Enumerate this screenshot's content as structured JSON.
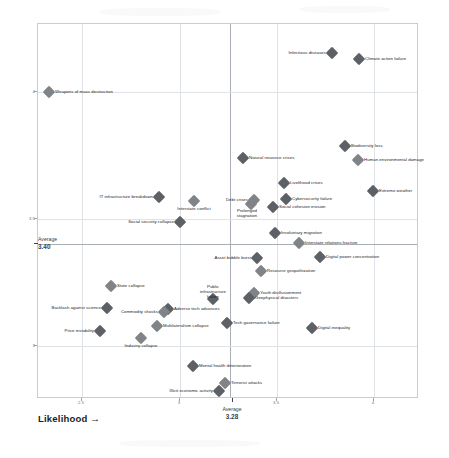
{
  "chart_data": {
    "type": "scatter",
    "title": "",
    "xlabel": "Likelihood →",
    "ylabel": "Impact →",
    "xlim": [
      2.3,
      4.12
    ],
    "ylim": [
      2.72,
      4.3
    ],
    "xticks": [
      "2.5",
      "3",
      "3.5",
      "4"
    ],
    "xtick_values": [
      2.5,
      3.0,
      3.5,
      4.0
    ],
    "yticks": [
      "4",
      "3.5",
      "3"
    ],
    "ytick_values": [
      4.0,
      3.5,
      3.0
    ],
    "grid": true,
    "legend": "none",
    "averages": {
      "x_label": "Average",
      "x_value": "3.28",
      "y_label": "Average",
      "y_value": "3.40"
    },
    "marker_color": "#808388",
    "marker_color_dark": "#5d6166",
    "points": [
      {
        "label": "Infectious diseases",
        "x": 3.54,
        "y": 4.22,
        "px": 331,
        "py": 52,
        "lpos": "left",
        "shade": "dark"
      },
      {
        "label": "Climate action failure",
        "x": 3.68,
        "y": 4.18,
        "px": 358,
        "py": 58,
        "lpos": "right",
        "shade": "dark"
      },
      {
        "label": "Weapons of mass destruction",
        "x": 2.37,
        "y": 4.0,
        "px": 48,
        "py": 91,
        "lpos": "right",
        "shade": "mid"
      },
      {
        "label": "Biodiversity loss",
        "x": 3.4,
        "y": 3.78,
        "px": 344,
        "py": 145,
        "lpos": "right",
        "shade": "dark"
      },
      {
        "label": "Natural resource crises",
        "x": 3.17,
        "y": 3.74,
        "px": 242,
        "py": 157,
        "lpos": "right",
        "shade": "dark"
      },
      {
        "label": "Human environmental damage",
        "x": 3.67,
        "y": 3.72,
        "px": 357,
        "py": 159,
        "lpos": "right",
        "shade": "mid"
      },
      {
        "label": "Livelihood crises",
        "x": 3.32,
        "y": 3.6,
        "px": 283,
        "py": 182,
        "lpos": "right",
        "shade": "dark"
      },
      {
        "label": "Debt crises",
        "x": 3.22,
        "y": 3.54,
        "px": 253,
        "py": 199,
        "lpos": "left",
        "shade": "mid"
      },
      {
        "label": "Extreme weather",
        "x": 3.8,
        "y": 3.58,
        "px": 372,
        "py": 190,
        "lpos": "right",
        "shade": "dark"
      },
      {
        "label": "Cybersecurity failure",
        "x": 3.31,
        "y": 3.52,
        "px": 285,
        "py": 198,
        "lpos": "right",
        "shade": "dark"
      },
      {
        "label": "IT infrastructure breakdown",
        "x": 3.0,
        "y": 3.55,
        "px": 158,
        "py": 196,
        "lpos": "left",
        "shade": "dark"
      },
      {
        "label": "Interstate conflict",
        "x": 3.08,
        "y": 3.52,
        "px": 193,
        "py": 200,
        "lpos": "below",
        "shade": "mid"
      },
      {
        "label": "Prolonged stagnation",
        "x": 3.2,
        "y": 3.5,
        "px": 250,
        "py": 203,
        "lpos": "below",
        "shade": "mid"
      },
      {
        "label": "Social cohesion erosion",
        "x": 3.29,
        "y": 3.49,
        "px": 272,
        "py": 206,
        "lpos": "right",
        "shade": "dark"
      },
      {
        "label": "Social security collapse",
        "x": 3.05,
        "y": 3.44,
        "px": 179,
        "py": 221,
        "lpos": "left",
        "shade": "dark"
      },
      {
        "label": "Involuntary migration",
        "x": 3.35,
        "y": 3.42,
        "px": 274,
        "py": 232,
        "lpos": "right",
        "shade": "dark"
      },
      {
        "label": "Interstate relations fracture",
        "x": 3.46,
        "y": 3.4,
        "px": 298,
        "py": 242,
        "lpos": "right",
        "shade": "mid"
      },
      {
        "label": "Asset bubble burst",
        "x": 3.26,
        "y": 3.36,
        "px": 256,
        "py": 257,
        "lpos": "left",
        "shade": "dark"
      },
      {
        "label": "Digital power concentration",
        "x": 3.63,
        "y": 3.36,
        "px": 319,
        "py": 256,
        "lpos": "right",
        "shade": "dark"
      },
      {
        "label": "Resource geopolitization",
        "x": 3.42,
        "y": 3.31,
        "px": 260,
        "py": 270,
        "lpos": "right",
        "shade": "mid"
      },
      {
        "label": "State collapse",
        "x": 2.69,
        "y": 3.26,
        "px": 110,
        "py": 285,
        "lpos": "right",
        "shade": "mid"
      },
      {
        "label": "Youth disillusionment",
        "x": 3.46,
        "y": 3.25,
        "px": 253,
        "py": 292,
        "lpos": "right",
        "shade": "mid"
      },
      {
        "label": "Public infrastructure failure",
        "x": 3.22,
        "y": 3.2,
        "px": 212,
        "py": 298,
        "lpos": "above",
        "shade": "dark"
      },
      {
        "label": "Geophysical disasters",
        "x": 3.42,
        "y": 3.22,
        "px": 248,
        "py": 297,
        "lpos": "right",
        "shade": "dark"
      },
      {
        "label": "Backlash against science",
        "x": 2.76,
        "y": 3.2,
        "px": 106,
        "py": 307,
        "lpos": "left",
        "shade": "dark"
      },
      {
        "label": "Adverse tech advances",
        "x": 3.1,
        "y": 3.2,
        "px": 167,
        "py": 308,
        "lpos": "right",
        "shade": "dark"
      },
      {
        "label": "Commodity shocks",
        "x": 3.07,
        "y": 3.18,
        "px": 163,
        "py": 311,
        "lpos": "left",
        "shade": "mid"
      },
      {
        "label": "Tech governance failure",
        "x": 3.33,
        "y": 3.15,
        "px": 226,
        "py": 322,
        "lpos": "right",
        "shade": "dark"
      },
      {
        "label": "Price instability",
        "x": 2.64,
        "y": 3.12,
        "px": 99,
        "py": 330,
        "lpos": "left",
        "shade": "dark"
      },
      {
        "label": "Multilateralism collapse",
        "x": 3.0,
        "y": 3.14,
        "px": 156,
        "py": 325,
        "lpos": "right",
        "shade": "mid"
      },
      {
        "label": "Digital inequality",
        "x": 3.62,
        "y": 3.13,
        "px": 311,
        "py": 327,
        "lpos": "right",
        "shade": "dark"
      },
      {
        "label": "Industry collapse",
        "x": 2.92,
        "y": 3.1,
        "px": 140,
        "py": 337,
        "lpos": "below",
        "shade": "mid"
      },
      {
        "label": "Mental health deterioration",
        "x": 3.13,
        "y": 2.97,
        "px": 192,
        "py": 365,
        "lpos": "right",
        "shade": "dark"
      },
      {
        "label": "Terrorist attacks",
        "x": 3.25,
        "y": 2.9,
        "px": 224,
        "py": 382,
        "lpos": "right",
        "shade": "mid"
      },
      {
        "label": "Illicit economic activity",
        "x": 3.22,
        "y": 2.87,
        "px": 218,
        "py": 390,
        "lpos": "left",
        "shade": "dark"
      }
    ]
  }
}
